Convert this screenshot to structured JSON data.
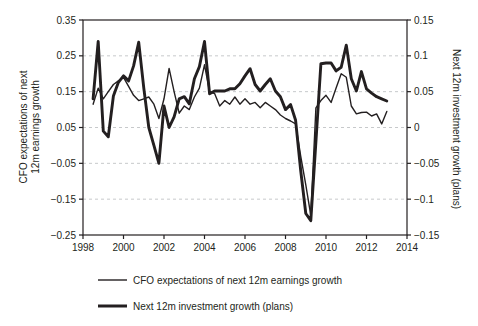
{
  "figure": {
    "background_color": "#ffffff",
    "line_color": "#231f20",
    "grid_color": "#c7c9cb",
    "left_axis": {
      "title_line1": "CFO expectations of next",
      "title_line2": "12m earnings growth",
      "tick_labels": [
        "0.35",
        "0.25",
        "0.15",
        "0.05",
        "−0.05",
        "−0.15",
        "−0.25"
      ],
      "tick_values": [
        0.35,
        0.25,
        0.15,
        0.05,
        -0.05,
        -0.15,
        -0.25
      ]
    },
    "right_axis": {
      "title": "Next 12m investment growth (plans)",
      "tick_labels": [
        "0.15",
        "0.1",
        "0.05",
        "0",
        "−0.05",
        "−0.1",
        "−0.15"
      ],
      "tick_values": [
        0.15,
        0.1,
        0.05,
        0,
        -0.05,
        -0.1,
        -0.15
      ]
    },
    "x_axis": {
      "tick_labels": [
        "1998",
        "2000",
        "2002",
        "2004",
        "2006",
        "2008",
        "2010",
        "2012",
        "2014"
      ],
      "tick_values": [
        1998,
        2000,
        2002,
        2004,
        2006,
        2008,
        2010,
        2012,
        2014
      ]
    }
  },
  "legend": {
    "items": [
      {
        "label": "CFO expectations of next 12m earnings growth",
        "style": "thin"
      },
      {
        "label": "Next 12m investment growth (plans)",
        "style": "thick"
      }
    ]
  },
  "chart_data": {
    "type": "line",
    "title": "",
    "x_unit": "quarterly (decimal years)",
    "xlim": [
      1998,
      2014
    ],
    "left_ylim": [
      -0.25,
      0.35
    ],
    "right_ylim": [
      -0.15,
      0.15
    ],
    "gridlines_at_left_values": [
      0.25,
      0.15,
      0.05,
      -0.05,
      -0.15
    ],
    "grid_style": "horizontal-dashed",
    "legend_position": "below-left",
    "x": [
      1998.5,
      1998.75,
      1999.0,
      1999.25,
      1999.5,
      1999.75,
      2000.0,
      2000.25,
      2000.5,
      2000.75,
      2001.0,
      2001.25,
      2001.5,
      2001.75,
      2002.0,
      2002.25,
      2002.5,
      2002.75,
      2003.0,
      2003.25,
      2003.5,
      2003.75,
      2004.0,
      2004.25,
      2004.5,
      2004.75,
      2005.0,
      2005.25,
      2005.5,
      2005.75,
      2006.0,
      2006.25,
      2006.5,
      2006.75,
      2007.0,
      2007.25,
      2007.5,
      2007.75,
      2008.0,
      2008.25,
      2008.5,
      2008.75,
      2009.0,
      2009.25,
      2009.5,
      2009.75,
      2010.0,
      2010.25,
      2010.5,
      2010.75,
      2011.0,
      2011.25,
      2011.5,
      2011.75,
      2012.0,
      2012.25,
      2012.5,
      2012.75,
      2013.0
    ],
    "series": [
      {
        "name": "CFO expectations of next 12m earnings growth",
        "axis": "left",
        "line": "thin",
        "values": [
          0.115,
          0.16,
          0.13,
          0.15,
          0.17,
          0.18,
          0.19,
          0.165,
          0.14,
          0.125,
          0.13,
          0.135,
          0.115,
          0.075,
          0.13,
          0.215,
          0.15,
          0.09,
          0.11,
          0.1,
          0.135,
          0.16,
          0.225,
          0.15,
          0.145,
          0.11,
          0.125,
          0.115,
          0.135,
          0.115,
          0.13,
          0.115,
          0.12,
          0.105,
          0.12,
          0.11,
          0.1,
          0.085,
          0.075,
          0.068,
          0.06,
          -0.03,
          -0.11,
          -0.195,
          0.105,
          0.125,
          0.14,
          0.12,
          0.16,
          0.2,
          0.19,
          0.11,
          0.088,
          0.092,
          0.093,
          0.082,
          0.088,
          0.06,
          0.095
        ]
      },
      {
        "name": "Next 12m investment growth (plans)",
        "axis": "right",
        "line": "thick",
        "values": [
          0.04,
          0.12,
          -0.005,
          -0.013,
          0.044,
          0.063,
          0.072,
          0.065,
          0.086,
          0.119,
          0.055,
          0.0,
          -0.025,
          -0.05,
          0.03,
          0.0,
          0.015,
          0.04,
          0.043,
          0.033,
          0.068,
          0.085,
          0.12,
          0.047,
          0.051,
          0.051,
          0.051,
          0.054,
          0.054,
          0.061,
          0.072,
          0.082,
          0.06,
          0.051,
          0.06,
          0.068,
          0.051,
          0.043,
          0.025,
          0.032,
          0.01,
          -0.06,
          -0.12,
          -0.13,
          -0.02,
          0.089,
          0.09,
          0.09,
          0.079,
          0.084,
          0.115,
          0.068,
          0.051,
          0.078,
          0.054,
          0.048,
          0.043,
          0.04,
          0.037
        ]
      }
    ]
  }
}
